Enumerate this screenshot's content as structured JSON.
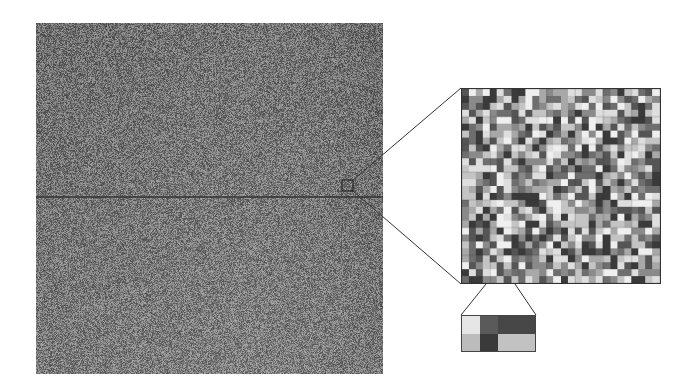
{
  "figure": {
    "main_image": {
      "description": "grayscale noise texture",
      "x": 36,
      "y": 23,
      "width": 347,
      "height": 351,
      "base_color": "#7a7a7a",
      "horizontal_line_y": 197,
      "line_color": "#333333"
    },
    "selection_box": {
      "x": 342,
      "y": 180,
      "width": 11,
      "height": 11,
      "stroke": "#222222"
    },
    "zoom_grid": {
      "x": 461,
      "y": 88,
      "width": 200,
      "height": 196,
      "cols": 28,
      "rows": 28,
      "seed": 7,
      "palette": [
        "#3a3a3a",
        "#555555",
        "#6e6e6e",
        "#8a8a8a",
        "#a8a8a8",
        "#c4c4c4",
        "#dedede",
        "#efefef"
      ]
    },
    "inset": {
      "x": 461,
      "y": 315,
      "width": 75,
      "height": 37,
      "cells": [
        {
          "color": "#e6e6e6"
        },
        {
          "color": "#5a5a5a"
        },
        {
          "color": "#474747"
        },
        {
          "color": "#bcbcbc"
        },
        {
          "color": "#3a3a3a"
        },
        {
          "color": "#c2c2c2"
        }
      ]
    },
    "connectors": [
      {
        "x1": 353,
        "y1": 180,
        "x2": 461,
        "y2": 88
      },
      {
        "x1": 353,
        "y1": 191,
        "x2": 461,
        "y2": 284
      },
      {
        "x1": 486,
        "y1": 284,
        "x2": 461,
        "y2": 315
      },
      {
        "x1": 515,
        "y1": 284,
        "x2": 536,
        "y2": 315
      }
    ]
  }
}
